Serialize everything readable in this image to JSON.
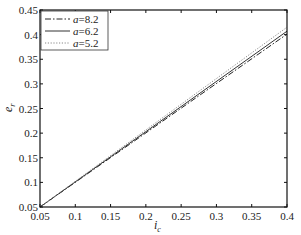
{
  "chart_data": {
    "type": "line",
    "title": "",
    "xlabel": "i_c",
    "ylabel": "e_r",
    "xlim": [
      0.05,
      0.4
    ],
    "ylim": [
      0.05,
      0.45
    ],
    "xticks": [
      0.05,
      0.1,
      0.15,
      0.2,
      0.25,
      0.3,
      0.35,
      0.4
    ],
    "xtick_labels": [
      "0.05",
      "0.1",
      "0.15",
      "0.2",
      "0.25",
      "0.3",
      "0.35",
      "0.4"
    ],
    "yticks": [
      0.05,
      0.1,
      0.15,
      0.2,
      0.25,
      0.3,
      0.35,
      0.4,
      0.45
    ],
    "ytick_labels": [
      "0.05",
      "0.1",
      "0.15",
      "0.2",
      "0.25",
      "0.3",
      "0.35",
      "0.4",
      "0.45"
    ],
    "grid": false,
    "legend_position": "upper left",
    "series": [
      {
        "name": "a=8.2",
        "param": "a",
        "value": "8.2",
        "style": "dashdot",
        "color": "#222222",
        "x": [
          0.05,
          0.4
        ],
        "y": [
          0.05,
          0.401
        ]
      },
      {
        "name": "a=6.2",
        "param": "a",
        "value": "6.2",
        "style": "solid",
        "color": "#333333",
        "x": [
          0.05,
          0.4
        ],
        "y": [
          0.05,
          0.407
        ]
      },
      {
        "name": "a=5.2",
        "param": "a",
        "value": "5.2",
        "style": "dotted",
        "color": "#888888",
        "x": [
          0.05,
          0.4
        ],
        "y": [
          0.05,
          0.415
        ]
      }
    ]
  },
  "labels": {
    "xlabel_main": "i",
    "xlabel_sub": "c",
    "ylabel_main": "e",
    "ylabel_sub": "r"
  }
}
